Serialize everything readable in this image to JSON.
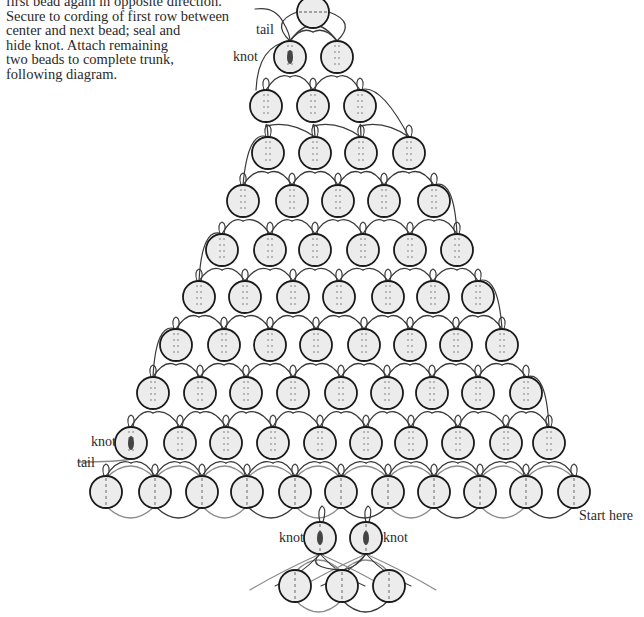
{
  "instructions": {
    "lines": [
      "first bead again in opposite direction.",
      "Secure to cording of first row between",
      "center and next bead; seal and",
      "hide knot. Attach remaining",
      "two beads to complete trunk,",
      "following diagram."
    ]
  },
  "labels": {
    "tail_top": "tail",
    "knot_top": "knot",
    "knot_left": "knot",
    "tail_left": "tail",
    "knot_trunk_left": "knot",
    "knot_trunk_right": "knot",
    "start_here": "Start here"
  },
  "diagram": {
    "bead_radius": 16,
    "colors": {
      "bead_fill": "#ececec",
      "bead_stroke": "#1a1a1a",
      "cord_dark": "#3a3a3a",
      "cord_light": "#8a8a8a",
      "knot": "#444444"
    },
    "rows": [
      {
        "y": 12,
        "xs": [
          313
        ],
        "style": "top"
      },
      {
        "y": 57,
        "xs": [
          290,
          337
        ],
        "knot_index": 0
      },
      {
        "y": 106,
        "xs": [
          266,
          313,
          360
        ]
      },
      {
        "y": 153,
        "xs": [
          268,
          315,
          361,
          409
        ]
      },
      {
        "y": 201,
        "xs": [
          243,
          292,
          338,
          384,
          434
        ]
      },
      {
        "y": 250,
        "xs": [
          222,
          270,
          315,
          363,
          410,
          457
        ]
      },
      {
        "y": 297,
        "xs": [
          199,
          245,
          293,
          339,
          388,
          433,
          478
        ]
      },
      {
        "y": 345,
        "xs": [
          176,
          224,
          270,
          316,
          364,
          410,
          456,
          502
        ]
      },
      {
        "y": 393,
        "xs": [
          153,
          200,
          246,
          293,
          341,
          387,
          432,
          478,
          526
        ]
      },
      {
        "y": 443,
        "xs": [
          131,
          180,
          226,
          273,
          320,
          366,
          411,
          458,
          506,
          549
        ],
        "knot_index": 0
      },
      {
        "y": 492,
        "xs": [
          106,
          155,
          202,
          247,
          295,
          341,
          388,
          434,
          480,
          526,
          574
        ],
        "style": "base"
      },
      {
        "y": 538,
        "xs": [
          320,
          366
        ],
        "knot_index": [
          0,
          1
        ],
        "style": "trunk-knot"
      },
      {
        "y": 586,
        "xs": [
          295,
          342,
          389
        ],
        "style": "base"
      }
    ]
  }
}
